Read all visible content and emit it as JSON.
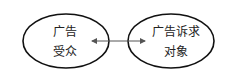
{
  "diagram": {
    "nodes": [
      {
        "id": "audience",
        "lines": [
          "广告",
          "受众"
        ]
      },
      {
        "id": "appeal_object",
        "lines": [
          "广告诉求",
          "对象"
        ]
      }
    ],
    "edges": [
      {
        "from": "audience",
        "to": "appeal_object",
        "type": "bidirectional-arrow"
      }
    ],
    "colors": {
      "stroke": "#111111",
      "arrow": "#555555",
      "background": "#ffffff"
    }
  }
}
